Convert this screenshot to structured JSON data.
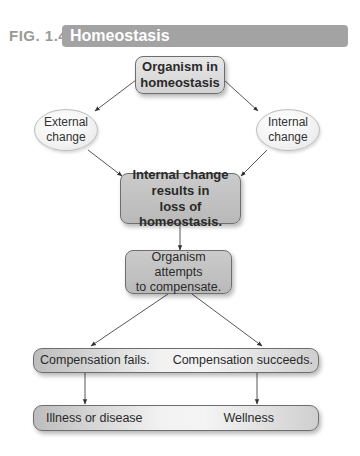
{
  "figure": {
    "number": "FIG. 1.4",
    "title": "Homeostasis",
    "colors": {
      "title_bar": "#a3a3a3",
      "label": "#9a9a9a"
    }
  },
  "nodes": {
    "organism_homeostasis": {
      "line1": "Organism in",
      "line2": "homeostasis"
    },
    "external_change": {
      "line1": "External",
      "line2": "change"
    },
    "internal_change": {
      "line1": "Internal",
      "line2": "change"
    },
    "loss_homeostasis": {
      "line1": "Internal change",
      "line2": "results in",
      "line3": "loss of homeostasis."
    },
    "attempts_compensate": {
      "line1": "Organism attempts",
      "line2": "to compensate."
    },
    "compensation": {
      "left": "Compensation fails.",
      "right": "Compensation succeeds."
    },
    "outcome": {
      "left": "Illness or disease",
      "right": "Wellness"
    }
  }
}
